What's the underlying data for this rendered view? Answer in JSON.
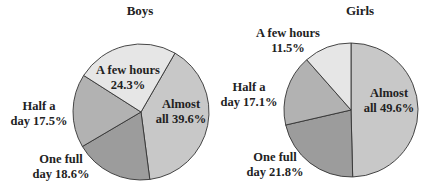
{
  "chart_data": [
    {
      "type": "pie",
      "title": "Boys",
      "start_angle_deg": 30,
      "direction": "clockwise",
      "slices": [
        {
          "label": "Almost all",
          "value": 39.6,
          "color": "#c8c8c8",
          "line1": "Almost",
          "line2": "all 39.6%"
        },
        {
          "label": "One full day",
          "value": 18.6,
          "color": "#9c9c9c",
          "line1": "One full",
          "line2": "day 18.6%"
        },
        {
          "label": "Half a day",
          "value": 17.5,
          "color": "#b2b2b2",
          "line1": "Half a",
          "line2": "day 17.5%"
        },
        {
          "label": "A few hours",
          "value": 24.3,
          "color": "#e6e6e6",
          "line1": "A few hours",
          "line2": "24.3%"
        }
      ]
    },
    {
      "type": "pie",
      "title": "Girls",
      "start_angle_deg": 0,
      "direction": "clockwise",
      "slices": [
        {
          "label": "Almost all",
          "value": 49.6,
          "color": "#c8c8c8",
          "line1": "Almost",
          "line2": "all 49.6%"
        },
        {
          "label": "One full day",
          "value": 21.8,
          "color": "#9c9c9c",
          "line1": "One full",
          "line2": "day 21.8%"
        },
        {
          "label": "Half a day",
          "value": 17.1,
          "color": "#b2b2b2",
          "line1": "Half a",
          "line2": "day 17.1%"
        },
        {
          "label": "A few hours",
          "value": 11.5,
          "color": "#e6e6e6",
          "line1": "A few hours",
          "line2": "11.5%"
        }
      ]
    }
  ]
}
